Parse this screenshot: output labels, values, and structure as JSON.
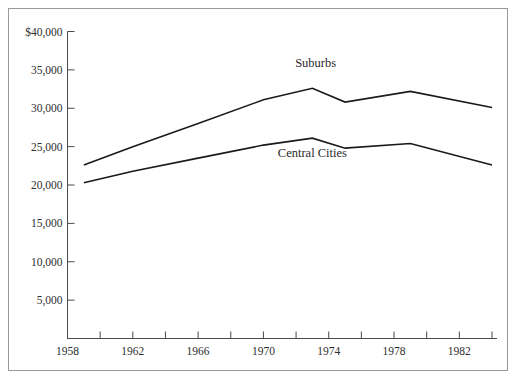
{
  "figure": {
    "top_caption_fragment": "",
    "frame_color": "#9a9a9a",
    "background_color": "#ffffff",
    "line_color": "#1a1a1a",
    "axis_color": "#4a4a4a"
  },
  "chart_data": {
    "type": "line",
    "title": "",
    "xlabel": "",
    "ylabel": "",
    "xlim": [
      1958,
      1984
    ],
    "ylim": [
      0,
      40000
    ],
    "grid": false,
    "legend_position": "inline-annotations",
    "y_ticks": [
      40000,
      35000,
      30000,
      25000,
      20000,
      15000,
      10000,
      5000
    ],
    "y_tick_labels": [
      "$40,000",
      "35,000",
      "30,000",
      "25,000",
      "20,000",
      "15,000",
      "10,000",
      "5,000"
    ],
    "x_ticks": [
      1958,
      1960,
      1962,
      1964,
      1966,
      1968,
      1970,
      1972,
      1974,
      1976,
      1978,
      1980,
      1982,
      1984
    ],
    "x_tick_labels": [
      "1958",
      "",
      "1962",
      "",
      "1966",
      "",
      "1970",
      "",
      "1974",
      "",
      "1978",
      "",
      "1982",
      ""
    ],
    "x_major_labels": [
      "1958",
      "1962",
      "1966",
      "1970",
      "1974",
      "1978",
      "1982"
    ],
    "series": [
      {
        "name": "Suburbs",
        "label_x": 1973.2,
        "label_y": 35400,
        "x": [
          1959,
          1962,
          1966,
          1970,
          1973,
          1975,
          1979,
          1984
        ],
        "values": [
          22600,
          25000,
          28000,
          31100,
          32600,
          30800,
          32200,
          30100
        ]
      },
      {
        "name": "Central Cities",
        "label_x": 1973.0,
        "label_y": 23600,
        "x": [
          1959,
          1962,
          1966,
          1970,
          1973,
          1975,
          1979,
          1984
        ],
        "values": [
          20300,
          21800,
          23500,
          25200,
          26100,
          24800,
          25400,
          22600
        ]
      }
    ]
  }
}
